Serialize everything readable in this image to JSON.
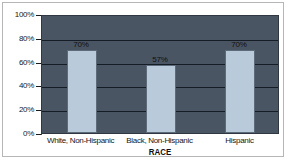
{
  "chart_data": {
    "type": "bar",
    "title": "",
    "subtitle": "",
    "xlabel": "RACE",
    "ylabel": "",
    "categories": [
      "White, Non-Hispanic",
      "Black, Non-Hispanic",
      "Hispanic"
    ],
    "values": [
      70,
      57,
      70
    ],
    "data_labels": [
      "70%",
      "57%",
      "70%"
    ],
    "ylim": [
      0,
      100
    ],
    "ytick_values": [
      0,
      20,
      40,
      60,
      80,
      100
    ],
    "ytick_labels": [
      "0%",
      "20%",
      "40%",
      "60%",
      "80%",
      "100%"
    ],
    "grid": true,
    "legend": false,
    "legend_position": "none",
    "series": [
      {
        "name": "Percent",
        "values": [
          70,
          57,
          70
        ]
      }
    ],
    "colors": {
      "plot_background": "#4a5564",
      "bar_fill": "#b9cbda",
      "bar_outline": "#5d6a78",
      "gridline": "#141c26",
      "axis": "#1b1b1b",
      "text": "#141414",
      "figure_background": "#ffffff",
      "figure_border": "#b6b6b6"
    }
  },
  "axis": {
    "x_title": "RACE"
  }
}
